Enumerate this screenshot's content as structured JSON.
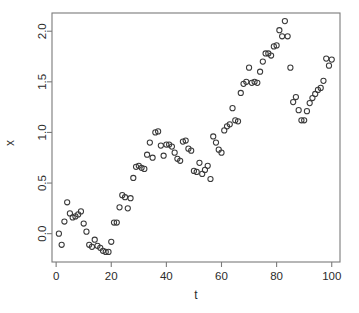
{
  "chart_data": {
    "type": "scatter",
    "title": "",
    "xlabel": "t",
    "ylabel": "x",
    "grid": false,
    "legend": null,
    "marker": "open-circle",
    "marker_color": "#3a3a3a",
    "xlim": [
      -1.5,
      103
    ],
    "ylim": [
      -0.28,
      2.18
    ],
    "xticks": [
      0,
      20,
      40,
      60,
      80,
      100
    ],
    "xtick_labels": [
      "0",
      "20",
      "40",
      "60",
      "80",
      "100"
    ],
    "yticks": [
      0.0,
      0.5,
      1.0,
      1.5,
      2.0
    ],
    "ytick_labels": [
      "0.0",
      "0.5",
      "1.0",
      "1.5",
      "2.0"
    ],
    "x": [
      1,
      2,
      3,
      4,
      5,
      6,
      7,
      8,
      9,
      10,
      11,
      12,
      13,
      14,
      15,
      16,
      17,
      18,
      19,
      20,
      21,
      22,
      23,
      24,
      25,
      26,
      27,
      28,
      29,
      30,
      31,
      32,
      33,
      34,
      35,
      36,
      37,
      38,
      39,
      40,
      41,
      42,
      43,
      44,
      45,
      46,
      47,
      48,
      49,
      50,
      51,
      52,
      53,
      54,
      55,
      56,
      57,
      58,
      59,
      60,
      61,
      62,
      63,
      64,
      65,
      66,
      67,
      68,
      69,
      70,
      71,
      72,
      73,
      74,
      75,
      76,
      77,
      78,
      79,
      80,
      81,
      82,
      83,
      84,
      85,
      86,
      87,
      88,
      89,
      90,
      91,
      92,
      93,
      94,
      95,
      96,
      97,
      98,
      99,
      100
    ],
    "y": [
      0.0,
      -0.11,
      0.12,
      0.31,
      0.2,
      0.16,
      0.17,
      0.19,
      0.22,
      0.1,
      0.02,
      -0.11,
      -0.13,
      -0.06,
      -0.12,
      -0.14,
      -0.17,
      -0.18,
      -0.18,
      -0.08,
      0.11,
      0.11,
      0.26,
      0.38,
      0.36,
      0.25,
      0.35,
      0.55,
      0.66,
      0.67,
      0.65,
      0.64,
      0.78,
      0.9,
      0.75,
      1.0,
      1.01,
      0.87,
      0.77,
      0.88,
      0.88,
      0.86,
      0.8,
      0.74,
      0.72,
      0.91,
      0.92,
      0.84,
      0.82,
      0.62,
      0.61,
      0.7,
      0.59,
      0.63,
      0.67,
      0.54,
      0.96,
      0.9,
      0.83,
      0.8,
      1.02,
      1.06,
      1.08,
      1.24,
      1.12,
      1.11,
      1.39,
      1.48,
      1.5,
      1.64,
      1.49,
      1.5,
      1.49,
      1.6,
      1.7,
      1.78,
      1.78,
      1.76,
      1.85,
      1.86,
      2.01,
      1.95,
      2.1,
      1.95,
      1.64,
      1.3,
      1.35,
      1.22,
      1.12,
      1.12,
      1.21,
      1.29,
      1.34,
      1.38,
      1.42,
      1.44,
      1.51,
      1.73,
      1.66,
      1.72
    ]
  },
  "axis": {
    "x_title": "t",
    "y_title": "x"
  }
}
